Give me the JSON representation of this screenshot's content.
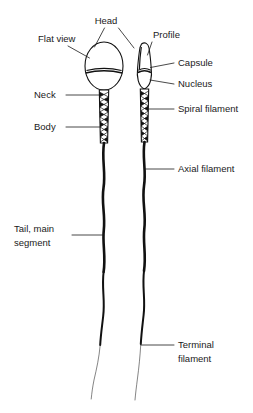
{
  "diagram": {
    "background_color": "#ffffff",
    "ink_color": "#111111",
    "text_color": "#1a1a1a",
    "views": [
      {
        "key": "flat",
        "label": "Flat view"
      },
      {
        "key": "profile",
        "label": "Profile"
      }
    ],
    "labels": {
      "head": "Head",
      "flat_view": "Flat view",
      "profile": "Profile",
      "capsule": "Capsule",
      "nucleus": "Nucleus",
      "neck": "Neck",
      "body": "Body",
      "spiral_filament": "Spiral filament",
      "axial_filament": "Axial filament",
      "tail_main_segment_line1": "Tail, main",
      "tail_main_segment_line2": "segment",
      "terminal_filament_line1": "Terminal",
      "terminal_filament_line2": "filament"
    },
    "label_list": [
      {
        "id": "head",
        "text": "Head",
        "side": "top-center",
        "x": 106,
        "y": 23
      },
      {
        "id": "flat-view",
        "text": "Flat view",
        "side": "left",
        "x": 38,
        "y": 42
      },
      {
        "id": "profile",
        "text": "Profile",
        "side": "right",
        "x": 152,
        "y": 38
      },
      {
        "id": "capsule",
        "text": "Capsule",
        "side": "right",
        "x": 177,
        "y": 66
      },
      {
        "id": "nucleus",
        "text": "Nucleus",
        "side": "right",
        "x": 177,
        "y": 87
      },
      {
        "id": "neck",
        "text": "Neck",
        "side": "left",
        "x": 34,
        "y": 98
      },
      {
        "id": "body",
        "text": "Body",
        "side": "left",
        "x": 34,
        "y": 130
      },
      {
        "id": "spiral-filament",
        "text": "Spiral filament",
        "side": "right",
        "x": 177,
        "y": 112
      },
      {
        "id": "axial-filament",
        "text": "Axial filament",
        "side": "right",
        "x": 177,
        "y": 172
      },
      {
        "id": "tail-main-segment",
        "text": "Tail, main segment",
        "side": "left",
        "x": 14,
        "y": 231
      },
      {
        "id": "terminal-filament",
        "text": "Terminal filament",
        "side": "right",
        "x": 177,
        "y": 348
      }
    ]
  }
}
